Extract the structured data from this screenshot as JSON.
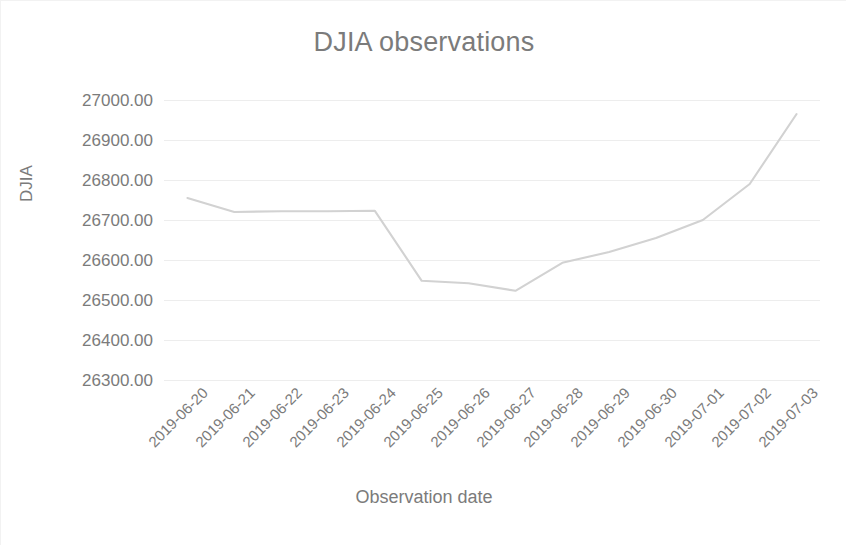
{
  "chart_data": {
    "type": "line",
    "title": "DJIA observations",
    "xlabel": "Observation date",
    "ylabel": "DJIA",
    "grid": true,
    "legend": false,
    "legend_position": "none",
    "line_color": "#d2d2d2",
    "text_color": "#7b7b7b",
    "background": "#ffffff",
    "ylim": [
      26300,
      27000
    ],
    "ytick_labels": [
      "27000.00",
      "26900.00",
      "26800.00",
      "26700.00",
      "26600.00",
      "26500.00",
      "26400.00",
      "26300.00"
    ],
    "yticks": [
      27000,
      26900,
      26800,
      26700,
      26600,
      26500,
      26400,
      26300
    ],
    "categories": [
      "2019-06-20",
      "2019-06-21",
      "2019-06-22",
      "2019-06-23",
      "2019-06-24",
      "2019-06-25",
      "2019-06-26",
      "2019-06-27",
      "2019-06-28",
      "2019-06-29",
      "2019-06-30",
      "2019-07-01",
      "2019-07-02",
      "2019-07-03"
    ],
    "values": [
      26755,
      26720,
      26722,
      26722,
      26723,
      26548,
      26542,
      26523,
      26593,
      26620,
      26655,
      26700,
      26790,
      26965
    ]
  }
}
